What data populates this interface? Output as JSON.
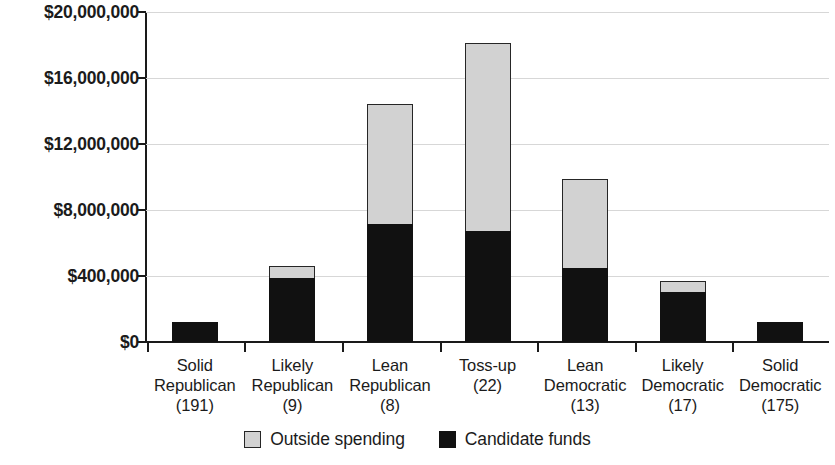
{
  "chart_data": {
    "type": "bar",
    "subtype": "stacked-vertical",
    "title": "",
    "xlabel": "",
    "ylabel": "",
    "grid": true,
    "legend_position": "bottom-center",
    "ylim": [
      0,
      20000000
    ],
    "ytick_values": [
      0,
      400000,
      8000000,
      12000000,
      16000000,
      20000000
    ],
    "ytick_labels": [
      "$0",
      "$400,000",
      "$8,000,000",
      "$12,000,000",
      "$16,000,000",
      "$20,000,000"
    ],
    "categories": [
      "Solid Republican (191)",
      "Likely Republican (9)",
      "Lean Republican (8)",
      "Toss-up (22)",
      "Lean Democratic (13)",
      "Likely Democratic (17)",
      "Solid Democratic (175)"
    ],
    "category_lines": [
      [
        "Solid",
        "Republican",
        "(191)"
      ],
      [
        "Likely",
        "Republican",
        "(9)"
      ],
      [
        "Lean",
        "Republican",
        "(8)"
      ],
      [
        "Toss-up",
        "(22)"
      ],
      [
        "Lean",
        "Democratic",
        "(13)"
      ],
      [
        "Likely",
        "Democratic",
        "(17)"
      ],
      [
        "Solid",
        "Democratic",
        "(175)"
      ]
    ],
    "series": [
      {
        "name": "Candidate funds",
        "color": "#111111",
        "values": [
          1200000,
          3900000,
          7150000,
          6700000,
          4500000,
          3050000,
          1200000
        ]
      },
      {
        "name": "Outside spending",
        "color": "#d2d2d2",
        "values": [
          0,
          700000,
          7250000,
          11400000,
          5400000,
          650000,
          0
        ]
      }
    ],
    "totals": [
      1200000,
      4600000,
      14400000,
      18100000,
      9900000,
      3700000,
      1200000
    ]
  },
  "legend": {
    "items": [
      {
        "label": "Outside spending",
        "swatch": "light-gray-square"
      },
      {
        "label": "Candidate funds",
        "swatch": "black-square"
      }
    ]
  }
}
